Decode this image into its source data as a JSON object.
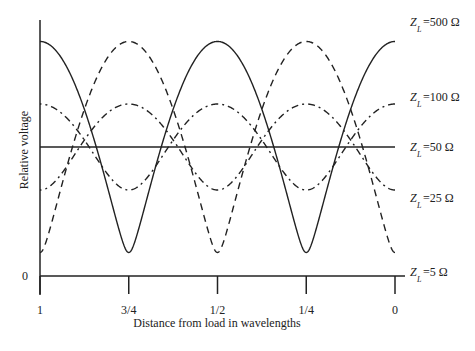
{
  "chart_data": {
    "type": "line",
    "title": "",
    "xlabel": "Distance from load in wavelengths",
    "ylabel": "Relative voltage",
    "x_ticks": [
      "1",
      "3/4",
      "1/2",
      "1/4",
      "0"
    ],
    "x_tick_values": [
      1,
      0.75,
      0.5,
      0.25,
      0
    ],
    "x_range": [
      1,
      0
    ],
    "y_ticks": [
      "0"
    ],
    "y_range": [
      0,
      1.82
    ],
    "grid": false,
    "legend_placement": "right",
    "line_z0_ohm": 50,
    "series": [
      {
        "name": "Z_L=500 Ω",
        "label_main": "Z",
        "label_sub": "L",
        "label_rest": "=500 Ω",
        "load_ohm": 500,
        "style": "solid",
        "max": 1.818,
        "min": 0.182,
        "at_load": "max"
      },
      {
        "name": "Z_L=100 Ω",
        "label_main": "Z",
        "label_sub": "L",
        "label_rest": "=100 Ω",
        "load_ohm": 100,
        "style": "dashdot",
        "max": 1.333,
        "min": 0.667,
        "at_load": "max"
      },
      {
        "name": "Z_L=50 Ω",
        "label_main": "Z",
        "label_sub": "L",
        "label_rest": "=50 Ω",
        "load_ohm": 50,
        "style": "solid",
        "max": 1.0,
        "min": 1.0,
        "at_load": "flat"
      },
      {
        "name": "Z_L=25 Ω",
        "label_main": "Z",
        "label_sub": "L",
        "label_rest": "=25 Ω",
        "load_ohm": 25,
        "style": "dashdot",
        "max": 1.333,
        "min": 0.667,
        "at_load": "min"
      },
      {
        "name": "Z_L=5 Ω",
        "label_main": "Z",
        "label_sub": "L",
        "label_rest": "=5 Ω",
        "load_ohm": 5,
        "style": "dashed",
        "max": 1.818,
        "min": 0.182,
        "at_load": "min"
      }
    ],
    "annotations": []
  }
}
